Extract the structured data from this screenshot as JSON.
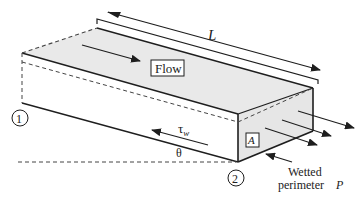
{
  "diagram": {
    "labels": {
      "length": "L",
      "flow": "Flow",
      "section_1": "1",
      "section_2": "2",
      "wall_shear": "τ",
      "wall_shear_sub": "w",
      "angle": "θ",
      "area": "A",
      "wetted_line1": "Wetted",
      "wetted_line2": "perimeter",
      "perimeter_symbol": "P"
    },
    "colors": {
      "line": "#1e1e1e",
      "fill": "#e8e8e8",
      "background": "#ffffff"
    }
  }
}
